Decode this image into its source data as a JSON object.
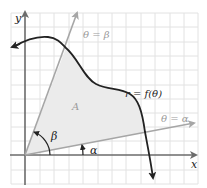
{
  "figure": {
    "labels": {
      "x_axis": "x",
      "y_axis": "y",
      "curve": "r = f(θ)",
      "ray_beta": "θ = β",
      "ray_alpha": "θ = α",
      "region": "A",
      "angle_beta": "β",
      "angle_alpha": "α"
    },
    "colors": {
      "background": "#ffffff",
      "grid": "#e2e2e2",
      "axis": "#6b6b6b",
      "curve": "#222222",
      "ray": "#a6a6a6",
      "region_fill": "#ebebeb",
      "ray_label": "#9a9a9a"
    }
  }
}
